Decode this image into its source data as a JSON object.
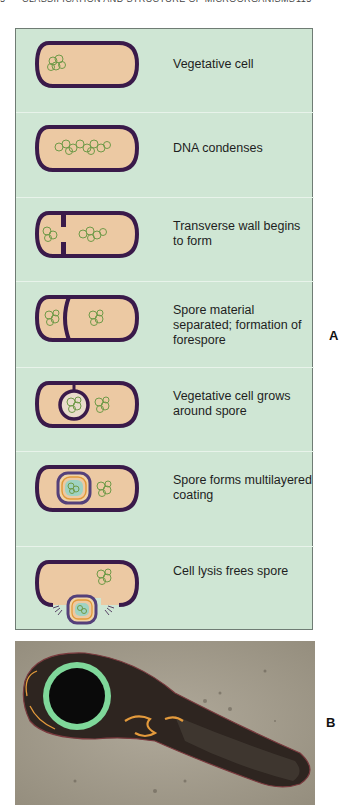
{
  "running_head": {
    "chapter_number": "5",
    "title": "Classification and Structure of Microorganisms",
    "page_number": "115"
  },
  "figure": {
    "panel_a": {
      "label": "A",
      "background": "#cfe6d4",
      "colors": {
        "cell_wall": "#3a1a4a",
        "cytoplasm": "#ecc9a3",
        "dna": "#6f9a48",
        "spore_coat_outer": "#54407a",
        "spore_coat_middle": "#e29a3a",
        "spore_core": "#9fd3c3"
      },
      "stages": [
        {
          "id": 1,
          "caption": "Vegetative cell"
        },
        {
          "id": 2,
          "caption": "DNA condenses"
        },
        {
          "id": 3,
          "caption": "Transverse wall begins to form"
        },
        {
          "id": 4,
          "caption": "Spore material separated; formation of forespore"
        },
        {
          "id": 5,
          "caption": "Vegetative cell grows around spore"
        },
        {
          "id": 6,
          "caption": "Spore forms multilayered coating"
        },
        {
          "id": 7,
          "caption": "Cell lysis frees spore"
        }
      ]
    },
    "panel_b": {
      "label": "B",
      "description": "Electron micrograph of sporulating bacterial cell with terminal endospore (colorized)",
      "colors": {
        "background": "#a39c8d",
        "cell": "#2e2520",
        "spore_ring": "#7fd89a",
        "highlight": "#e39a3c"
      }
    }
  }
}
